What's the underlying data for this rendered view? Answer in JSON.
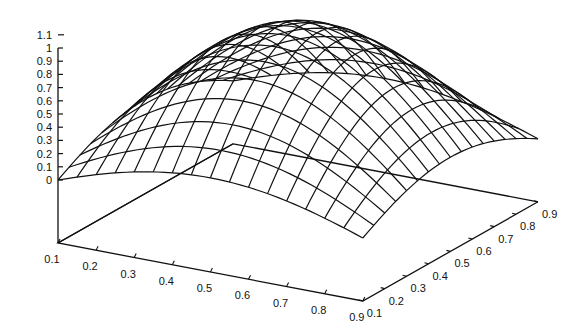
{
  "chart_data": {
    "type": "surface3d",
    "title": "",
    "function": "z = sin(pi*x) * sin(pi*y) (approx., peak ~1 at x=0.5, y=0.5)",
    "x": [
      0.1,
      0.2,
      0.3,
      0.4,
      0.5,
      0.6,
      0.7,
      0.8,
      0.9
    ],
    "y": [
      0.1,
      0.2,
      0.3,
      0.4,
      0.5,
      0.6,
      0.7,
      0.8,
      0.9
    ],
    "z_ticks": [
      "0",
      "0.1",
      "0.2",
      "0.3",
      "0.4",
      "0.5",
      "0.6",
      "0.7",
      "0.8",
      "0.9",
      "1",
      "1.1"
    ],
    "x_ticks": [
      "0.1",
      "0.2",
      "0.3",
      "0.4",
      "0.5",
      "0.6",
      "0.7",
      "0.8",
      "0.9"
    ],
    "y_ticks": [
      "0.1",
      "0.2",
      "0.3",
      "0.4",
      "0.5",
      "0.6",
      "0.7",
      "0.8",
      "0.9"
    ],
    "xlim": [
      0.1,
      0.9
    ],
    "ylim": [
      0.1,
      0.9
    ],
    "zlim": [
      0,
      1.1
    ],
    "xlabel": "",
    "ylabel": "",
    "zlabel": "",
    "grid": false,
    "legend": null,
    "mesh_lines_per_axis": 17,
    "style": "wireframe, black lines on white"
  },
  "colors": {
    "line": "#111111",
    "background": "#ffffff"
  }
}
